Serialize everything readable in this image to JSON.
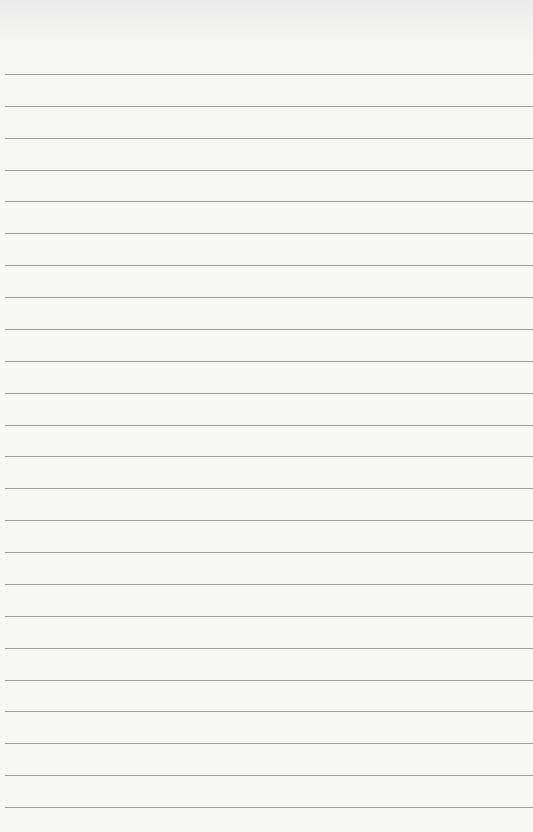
{
  "paper": {
    "type": "lined-paper",
    "background_color": "#f7f7f6",
    "rule_color": "#9a9a9a",
    "rule_count": 24,
    "first_rule_y": 74,
    "rule_spacing": 31.87
  }
}
